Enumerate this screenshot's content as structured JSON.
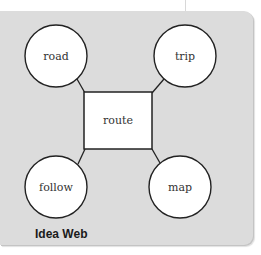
{
  "diagram": {
    "caption": "Idea Web",
    "center": {
      "label": "route",
      "shape": "rectangle"
    },
    "nodes": [
      {
        "id": "road",
        "label": "road",
        "position": "top-left",
        "shape": "circle"
      },
      {
        "id": "trip",
        "label": "trip",
        "position": "top-right",
        "shape": "circle"
      },
      {
        "id": "follow",
        "label": "follow",
        "position": "bottom-left",
        "shape": "circle"
      },
      {
        "id": "map",
        "label": "map",
        "position": "bottom-right",
        "shape": "circle"
      }
    ],
    "edges": [
      [
        "route",
        "road"
      ],
      [
        "route",
        "trip"
      ],
      [
        "route",
        "follow"
      ],
      [
        "route",
        "map"
      ]
    ],
    "colors": {
      "panel": "#dcdcdc",
      "node_fill": "#ffffff",
      "stroke": "#222222"
    }
  }
}
